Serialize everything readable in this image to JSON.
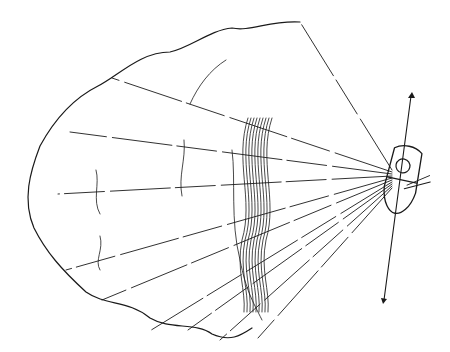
{
  "diagram": {
    "elements": {
      "boat": "boat-with-motor",
      "guide_line": "line-through-boat-with-arrow-ends",
      "rays": 10,
      "vegetation_zones": [
        "outer-weed-edge",
        "inner-weed-patches",
        "reed-stalks"
      ]
    },
    "caption_cutoff": ""
  },
  "colors": {
    "ink": "#1a1a1a",
    "background": "#ffffff"
  }
}
